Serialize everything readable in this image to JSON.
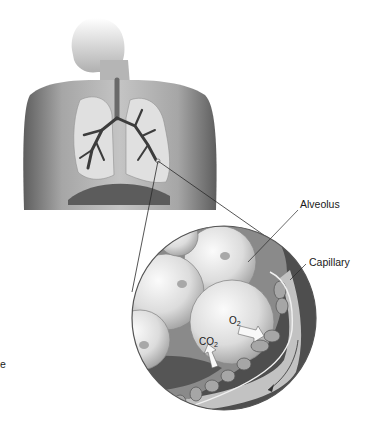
{
  "labels": {
    "alveolus": "Alveolus",
    "capillary": "Capillary",
    "o2": "O",
    "o2_sub": "2",
    "co2": "CO",
    "co2_sub": "2",
    "edge_fragment": "e"
  },
  "colors": {
    "background": "#ffffff",
    "skin_light": "#c8c8c8",
    "skin_dark": "#6e6e6e",
    "lung": "#d9d9d9",
    "bronchi": "#3c3c3c",
    "diaphragm": "#555555",
    "alveolus_light": "#f2f2f2",
    "alveolus_mid": "#bdbdbd",
    "capillary_dark": "#4a4a4a",
    "capillary_band": "#bebebe",
    "red_cell": "#9a9a9a",
    "leader_line": "#2a2a2a"
  }
}
